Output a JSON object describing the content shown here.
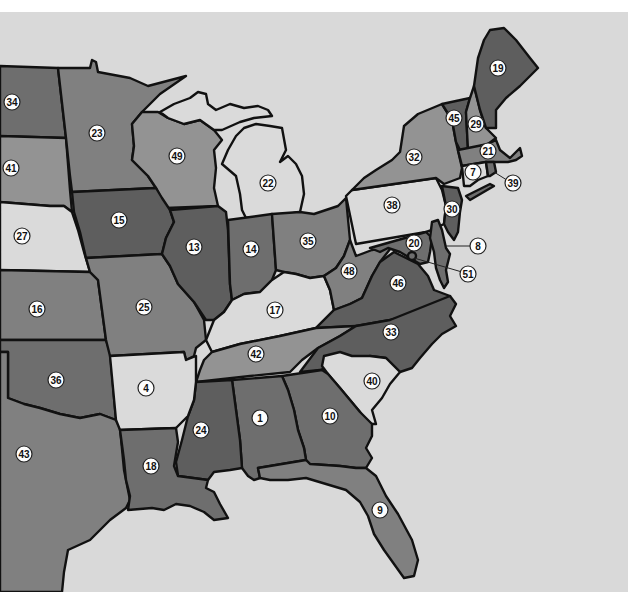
{
  "map": {
    "title": "",
    "background_color": "#d9d9d9",
    "shade_colors": {
      "dark": "#5e5e5e",
      "medium_dark": "#6e6e6e",
      "medium": "#808080",
      "light_medium": "#939393",
      "light": "#dadada"
    },
    "states": [
      {
        "id": "34",
        "label": "34",
        "shade": "medium_dark",
        "x": 12,
        "y": 102
      },
      {
        "id": "23",
        "label": "23",
        "shade": "medium",
        "x": 97,
        "y": 133
      },
      {
        "id": "41",
        "label": "41",
        "shade": "light_medium",
        "x": 11,
        "y": 168
      },
      {
        "id": "49",
        "label": "49",
        "shade": "light_medium",
        "x": 177,
        "y": 156
      },
      {
        "id": "22",
        "label": "22",
        "shade": "light",
        "x": 268,
        "y": 183
      },
      {
        "id": "27",
        "label": "27",
        "shade": "light",
        "x": 22,
        "y": 236
      },
      {
        "id": "15",
        "label": "15",
        "shade": "dark",
        "x": 119,
        "y": 220
      },
      {
        "id": "13",
        "label": "13",
        "shade": "dark",
        "x": 194,
        "y": 247
      },
      {
        "id": "14",
        "label": "14",
        "shade": "medium_dark",
        "x": 251,
        "y": 249
      },
      {
        "id": "35",
        "label": "35",
        "shade": "medium",
        "x": 308,
        "y": 241
      },
      {
        "id": "16",
        "label": "16",
        "shade": "medium",
        "x": 37,
        "y": 309
      },
      {
        "id": "25",
        "label": "25",
        "shade": "medium",
        "x": 144,
        "y": 307
      },
      {
        "id": "17",
        "label": "17",
        "shade": "light",
        "x": 275,
        "y": 310
      },
      {
        "id": "42",
        "label": "42",
        "shade": "light_medium",
        "x": 256,
        "y": 354
      },
      {
        "id": "36",
        "label": "36",
        "shade": "medium_dark",
        "x": 56,
        "y": 380
      },
      {
        "id": "4",
        "label": "4",
        "shade": "light",
        "x": 146,
        "y": 388
      },
      {
        "id": "24",
        "label": "24",
        "shade": "dark",
        "x": 201,
        "y": 430
      },
      {
        "id": "1",
        "label": "1",
        "shade": "medium_dark",
        "x": 260,
        "y": 418
      },
      {
        "id": "10",
        "label": "10",
        "shade": "medium_dark",
        "x": 330,
        "y": 416
      },
      {
        "id": "43",
        "label": "43",
        "shade": "medium",
        "x": 24,
        "y": 454
      },
      {
        "id": "18",
        "label": "18",
        "shade": "medium_dark",
        "x": 151,
        "y": 466
      },
      {
        "id": "9",
        "label": "9",
        "shade": "medium",
        "x": 380,
        "y": 510
      },
      {
        "id": "40",
        "label": "40",
        "shade": "light",
        "x": 372,
        "y": 381
      },
      {
        "id": "33",
        "label": "33",
        "shade": "dark",
        "x": 391,
        "y": 332
      },
      {
        "id": "46",
        "label": "46",
        "shade": "dark",
        "x": 398,
        "y": 283
      },
      {
        "id": "48",
        "label": "48",
        "shade": "medium",
        "x": 349,
        "y": 271
      },
      {
        "id": "38",
        "label": "38",
        "shade": "light",
        "x": 392,
        "y": 205
      },
      {
        "id": "32",
        "label": "32",
        "shade": "light_medium",
        "x": 414,
        "y": 157
      },
      {
        "id": "30",
        "label": "30",
        "shade": "dark",
        "x": 452,
        "y": 209
      },
      {
        "id": "20",
        "label": "20",
        "shade": "medium_dark",
        "x": 414,
        "y": 243
      },
      {
        "id": "45",
        "label": "45",
        "shade": "dark",
        "x": 454,
        "y": 118
      },
      {
        "id": "29",
        "label": "29",
        "shade": "light_medium",
        "x": 476,
        "y": 124
      },
      {
        "id": "19",
        "label": "19",
        "shade": "dark",
        "x": 498,
        "y": 68
      },
      {
        "id": "21",
        "label": "21",
        "shade": "medium",
        "x": 488,
        "y": 151
      },
      {
        "id": "7",
        "label": "7",
        "shade": "light",
        "x": 473,
        "y": 172
      },
      {
        "id": "39",
        "label": "39",
        "shade": "medium_dark",
        "x": 513,
        "y": 183
      },
      {
        "id": "8",
        "label": "8",
        "shade": "medium_dark",
        "x": 478,
        "y": 246
      },
      {
        "id": "51",
        "label": "51",
        "shade": "medium_dark",
        "x": 468,
        "y": 274
      }
    ]
  }
}
